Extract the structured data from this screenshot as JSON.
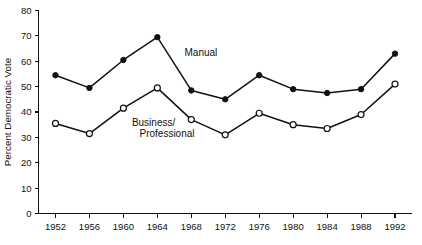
{
  "chart_data": {
    "type": "line",
    "title": "",
    "xlabel": "",
    "ylabel": "Percent Democratic Vote",
    "categories": [
      "1952",
      "1956",
      "1960",
      "1964",
      "1968",
      "1972",
      "1976",
      "1980",
      "1984",
      "1988",
      "1992"
    ],
    "x": [
      1952,
      1956,
      1960,
      1964,
      1968,
      1972,
      1976,
      1980,
      1984,
      1988,
      1992
    ],
    "xlim": [
      1950,
      1994
    ],
    "ylim": [
      0,
      80
    ],
    "y_ticks": [
      0,
      10,
      20,
      30,
      40,
      50,
      60,
      70,
      80
    ],
    "x_ticks": [
      1952,
      1956,
      1960,
      1964,
      1968,
      1972,
      1976,
      1980,
      1984,
      1988,
      1992
    ],
    "grid": false,
    "legend_position": "inline-annotation",
    "series": [
      {
        "name": "Manual",
        "marker": "filled-circle",
        "values": [
          54.5,
          49.5,
          60.5,
          69.5,
          48.5,
          45.0,
          54.5,
          49.0,
          47.5,
          49.0,
          63.0
        ]
      },
      {
        "name": "Business/Professional",
        "marker": "open-circle",
        "values": [
          35.5,
          31.5,
          41.5,
          49.5,
          37.0,
          31.0,
          39.5,
          35.0,
          33.5,
          39.0,
          51.0
        ]
      }
    ],
    "annotations": [
      {
        "text": "Manual",
        "x": 1967.2,
        "y": 62.0
      },
      {
        "text": "Business/",
        "x": 1961.0,
        "y": 34.5
      },
      {
        "text": "Professional",
        "x": 1961.9,
        "y": 30.0
      }
    ],
    "colors": {
      "axis": "#111111",
      "series_manual": "#111111",
      "series_business": "#111111",
      "background": "#ffffff"
    }
  }
}
